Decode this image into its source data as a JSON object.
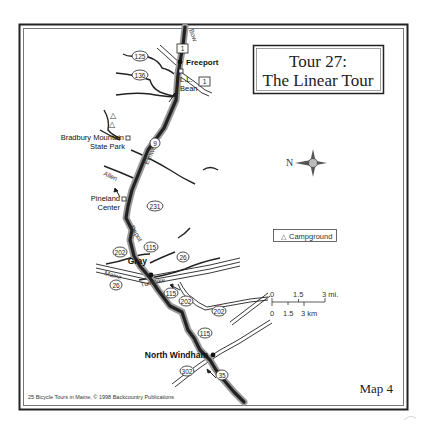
{
  "title": {
    "line1": "Tour 27:",
    "line2": "The Linear Tour"
  },
  "map_number": "Map 4",
  "credit": "25 Bicycle Tours in Maine, © 1998 Backcountry Publications",
  "places": {
    "freeport": "Freeport",
    "ll_bean_1": "L.L.",
    "ll_bean_2": "Bean",
    "bradbury_1": "Bradbury Mountain",
    "bradbury_2": "State Park",
    "pineland_1": "Pineland",
    "pineland_2": "Center",
    "gray": "Gray",
    "north_windham": "North Windham"
  },
  "roads": {
    "bow": "Bow",
    "elmwood": "Elmwood",
    "allen": "Allen",
    "depot": "Depot",
    "maine": "Maine",
    "turnpike": "Turnpike"
  },
  "route_shields": {
    "r1a": "1",
    "r1b": "1",
    "r125": "125",
    "r136": "136",
    "r9": "9",
    "r231": "231",
    "r115a": "115",
    "r202a": "202",
    "r26a": "26",
    "r26b": "26",
    "r115b": "115",
    "r202b": "202",
    "r202c": "202",
    "r115c": "115",
    "r302": "302",
    "r35": "35"
  },
  "compass": {
    "label": "N"
  },
  "legend": {
    "campground": "Campground",
    "campground_symbol": "△"
  },
  "scale": {
    "miles": [
      "0",
      "1.5",
      "3 mi."
    ],
    "km": [
      "0",
      "1.5",
      "3 km"
    ]
  },
  "colors": {
    "frame": "#333333",
    "route_shadow": "#9a9a9a",
    "route": "#222222",
    "ink": "#1a1a1a"
  }
}
